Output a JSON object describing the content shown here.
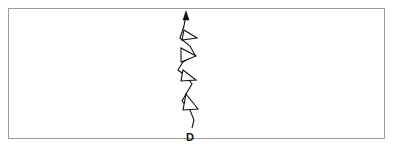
{
  "figure": {
    "width": 395,
    "height": 149,
    "background_color": "#ffffff",
    "border_color": "#9a9a9a",
    "line_color": "#111111"
  },
  "frame": {
    "x": 8,
    "y": 8,
    "width": 377,
    "height": 131,
    "border_width": 1
  },
  "front": {
    "type": "cold-front",
    "orientation": "vertical",
    "arrow_direction": "up",
    "barb_count": 4,
    "barb_side": "right",
    "barb_fill": "#ffffff",
    "spine_points": "186,14 184,26 180,38 190,46 195,55 183,62 178,70 186,76 192,84 186,94 182,101 190,110 194,120 192,128",
    "arrow_tip": {
      "x": 186,
      "y": 11
    },
    "barbs": [
      {
        "index": 1,
        "points": "184,30 197,38 182,40"
      },
      {
        "index": 2,
        "points": "181,48 196,56 181,62"
      },
      {
        "index": 3,
        "points": "183,70 196,80 181,81"
      },
      {
        "index": 4,
        "points": "186,94 198,109 183,110"
      }
    ]
  },
  "labels": {
    "bottom_label": "D",
    "bottom_label_x": 190,
    "bottom_label_y": 141
  }
}
